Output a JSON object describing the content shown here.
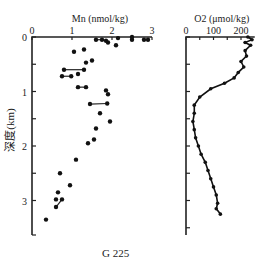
{
  "figure": {
    "station_label": "G 225",
    "ylabel": "深度(km)"
  },
  "chart_data": [
    {
      "type": "scatter",
      "title": "Mn (nmol/kg)",
      "xlabel": "Mn (nmol/kg)",
      "ylabel": "深度(km)",
      "xlim": [
        0,
        3
      ],
      "ylim": [
        3.5,
        0
      ],
      "xticks": [
        "0",
        "1",
        "2",
        "3"
      ],
      "yticks": [
        "0",
        "1",
        "2",
        "3"
      ],
      "grid": false,
      "points": [
        {
          "x": 1.6,
          "y": 0.05
        },
        {
          "x": 1.75,
          "y": 0.05
        },
        {
          "x": 1.85,
          "y": 0.07
        },
        {
          "x": 1.9,
          "y": 0.1
        },
        {
          "x": 2.15,
          "y": 0.02
        },
        {
          "x": 2.5,
          "y": 0.0
        },
        {
          "x": 2.5,
          "y": 0.05
        },
        {
          "x": 2.8,
          "y": 0.05
        },
        {
          "x": 2.9,
          "y": 0.05
        },
        {
          "x": 2.1,
          "y": 0.15
        },
        {
          "x": 1.05,
          "y": 0.27
        },
        {
          "x": 1.3,
          "y": 0.23
        },
        {
          "x": 1.35,
          "y": 0.47
        },
        {
          "x": 1.5,
          "y": 0.43
        },
        {
          "x": 0.8,
          "y": 0.6
        },
        {
          "x": 1.3,
          "y": 0.6
        },
        {
          "x": 1.15,
          "y": 0.68
        },
        {
          "x": 0.75,
          "y": 0.72
        },
        {
          "x": 0.98,
          "y": 0.72
        },
        {
          "x": 1.15,
          "y": 0.92
        },
        {
          "x": 1.35,
          "y": 0.92
        },
        {
          "x": 1.85,
          "y": 0.98
        },
        {
          "x": 1.9,
          "y": 1.05
        },
        {
          "x": 1.45,
          "y": 1.23
        },
        {
          "x": 1.88,
          "y": 1.22
        },
        {
          "x": 1.7,
          "y": 1.4
        },
        {
          "x": 1.95,
          "y": 1.55
        },
        {
          "x": 1.6,
          "y": 1.68
        },
        {
          "x": 1.55,
          "y": 1.88
        },
        {
          "x": 1.4,
          "y": 1.95
        },
        {
          "x": 1.1,
          "y": 2.25
        },
        {
          "x": 0.7,
          "y": 2.5
        },
        {
          "x": 0.95,
          "y": 2.72
        },
        {
          "x": 0.65,
          "y": 2.85
        },
        {
          "x": 0.6,
          "y": 2.98
        },
        {
          "x": 0.75,
          "y": 2.98
        },
        {
          "x": 0.6,
          "y": 3.12
        },
        {
          "x": 0.35,
          "y": 3.35
        }
      ],
      "connected_pairs": [
        [
          0,
          1
        ],
        [
          1,
          2
        ],
        [
          2,
          3
        ],
        [
          14,
          15
        ],
        [
          17,
          18
        ],
        [
          19,
          20
        ],
        [
          23,
          24
        ],
        [
          35,
          36
        ]
      ]
    },
    {
      "type": "line",
      "title": "O2 (μmol/kg)",
      "xlabel": "O2 (μmol/kg)",
      "xlim": [
        0,
        250
      ],
      "ylim": [
        3.5,
        0
      ],
      "xticks": [
        "0",
        "100",
        "200"
      ],
      "grid": false,
      "points": [
        {
          "x": 225,
          "y": 0.0
        },
        {
          "x": 240,
          "y": 0.05
        },
        {
          "x": 215,
          "y": 0.1
        },
        {
          "x": 235,
          "y": 0.15
        },
        {
          "x": 215,
          "y": 0.25
        },
        {
          "x": 220,
          "y": 0.35
        },
        {
          "x": 200,
          "y": 0.45
        },
        {
          "x": 210,
          "y": 0.55
        },
        {
          "x": 190,
          "y": 0.65
        },
        {
          "x": 175,
          "y": 0.75
        },
        {
          "x": 140,
          "y": 0.85
        },
        {
          "x": 90,
          "y": 0.95
        },
        {
          "x": 50,
          "y": 1.1
        },
        {
          "x": 30,
          "y": 1.25
        },
        {
          "x": 30,
          "y": 1.4
        },
        {
          "x": 25,
          "y": 1.55
        },
        {
          "x": 30,
          "y": 1.7
        },
        {
          "x": 35,
          "y": 1.85
        },
        {
          "x": 45,
          "y": 2.0
        },
        {
          "x": 55,
          "y": 2.15
        },
        {
          "x": 70,
          "y": 2.3
        },
        {
          "x": 80,
          "y": 2.45
        },
        {
          "x": 90,
          "y": 2.6
        },
        {
          "x": 100,
          "y": 2.75
        },
        {
          "x": 110,
          "y": 2.9
        },
        {
          "x": 115,
          "y": 3.05
        },
        {
          "x": 110,
          "y": 3.15
        },
        {
          "x": 125,
          "y": 3.25
        }
      ]
    }
  ]
}
